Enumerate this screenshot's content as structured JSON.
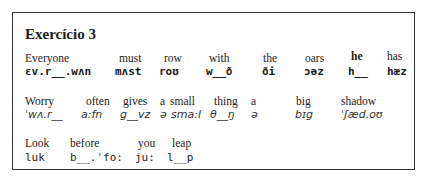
{
  "title": "Exercício 3",
  "lines": [
    {
      "words": [
        {
          "word": "Everyone",
          "ipa": "ɛv.r__.wʌn"
        },
        {
          "word": "must",
          "ipa": "mʌst"
        },
        {
          "word": "row",
          "ipa": "roʊ"
        },
        {
          "word": "with",
          "ipa": "w__ð"
        },
        {
          "word": "the",
          "ipa": "ði"
        },
        {
          "word": "oars",
          "ipa": "ɔəz"
        },
        {
          "word": "he",
          "ipa": "h__"
        },
        {
          "word": "has",
          "ipa": "hæz"
        }
      ]
    },
    {
      "words": [
        {
          "word": "Worry",
          "ipa": "ˈwʌ.r__"
        },
        {
          "word": "often",
          "ipa": "a:fn"
        },
        {
          "word": "gives",
          "ipa": "g__vz"
        },
        {
          "word": "a",
          "ipa": "ə"
        },
        {
          "word": "small",
          "ipa": "sma:l"
        },
        {
          "word": "thing",
          "ipa": "θ__ŋ"
        },
        {
          "word": "a",
          "ipa": "ə"
        },
        {
          "word": "big",
          "ipa": "bɪg"
        },
        {
          "word": "shadow",
          "ipa": "ˈʃæd.oʊ"
        }
      ]
    },
    {
      "words": [
        {
          "word": "Look",
          "ipa": "luk"
        },
        {
          "word": "before",
          "ipa": "b__.ˈfo:"
        },
        {
          "word": "you",
          "ipa": "ju:"
        },
        {
          "word": "leap",
          "ipa": "l__p"
        }
      ]
    }
  ]
}
